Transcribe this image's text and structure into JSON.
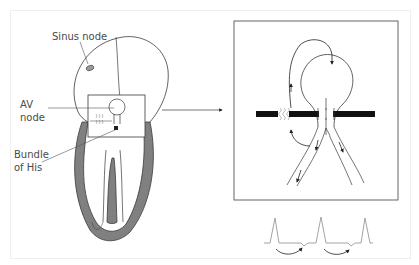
{
  "figure": {
    "labels": {
      "sinus_node": "Sinus node",
      "av_node_line1": "AV",
      "av_node_line2": "node",
      "bundle_line1": "Bundle",
      "bundle_line2": "of His"
    },
    "colors": {
      "myocardium": "#808080",
      "outline": "#3a3a3a",
      "ecg": "#9a9a9a",
      "block_bar": "#111111",
      "frame": "#efefef"
    },
    "panels": [
      {
        "id": "heart",
        "description": "Heart with sinus node, AV node region and bundle of His"
      },
      {
        "id": "av-reentry-detail",
        "description": "Magnified AV node with reentry circuit arrows and block bar"
      },
      {
        "id": "ecg-strip",
        "description": "ECG trace with three QRS complexes and curved arrows"
      }
    ]
  }
}
